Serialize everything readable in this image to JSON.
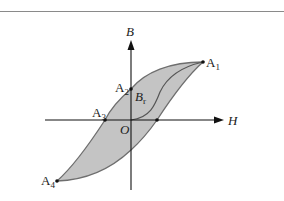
{
  "diagram": {
    "axes": {
      "x_label": "H",
      "y_label": "B",
      "origin_label": "O"
    },
    "points": [
      {
        "name": "A1",
        "base": "A",
        "sub": "1"
      },
      {
        "name": "A2",
        "base": "A",
        "sub": "2"
      },
      {
        "name": "A3",
        "base": "A",
        "sub": "3"
      },
      {
        "name": "A4",
        "base": "A",
        "sub": "4"
      }
    ],
    "remanence_label": {
      "base": "B",
      "sub": "r"
    },
    "colors": {
      "loop_fill": "#c4c4c4",
      "loop_stroke": "#6e6e6e",
      "axis": "#111111",
      "rule": "#8a8a8a"
    }
  }
}
